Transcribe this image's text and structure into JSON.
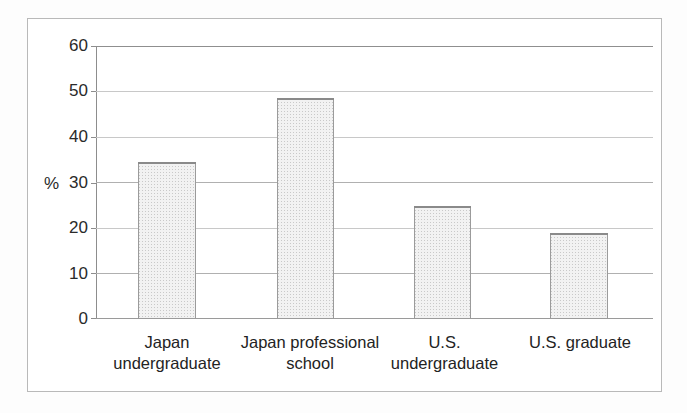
{
  "chart_data": {
    "type": "bar",
    "title": "",
    "subtitle": "",
    "xlabel": "",
    "ylabel": "%",
    "categories": [
      "Japan undergraduate",
      "Japan professional school",
      "U.S. undergraduate",
      "U.S. graduate"
    ],
    "category_lines": [
      [
        "Japan",
        "undergraduate"
      ],
      [
        "Japan professional",
        "school"
      ],
      [
        "U.S.",
        "undergraduate"
      ],
      [
        "U.S. graduate"
      ]
    ],
    "values": [
      34.4,
      48.6,
      24.8,
      18.8
    ],
    "ylim": [
      0,
      60
    ],
    "yticks": [
      0,
      10,
      20,
      30,
      40,
      50,
      60
    ],
    "ytick_labels": [
      "0",
      "10",
      "20",
      "30",
      "40",
      "50",
      "60"
    ],
    "grid": true,
    "grid_axis": "y",
    "legend": false,
    "legend_position": "none",
    "bar_fill": "#f2f2f2",
    "bar_pattern": "light-gray-stipple",
    "bar_border_color": "#9b9b9b",
    "gridline_color": "#c8c8c8",
    "axis_color": "#8d8d8d",
    "frame_color": "#b9b9b9",
    "text_color": "#232323",
    "background": "#ffffff"
  },
  "figure": {
    "axis_unit_label": "%",
    "frame_present": true
  }
}
